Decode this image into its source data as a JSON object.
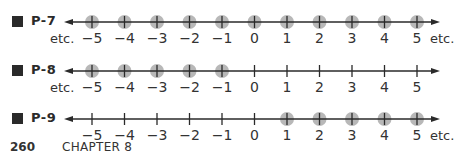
{
  "problems": [
    {
      "label": "P-7",
      "ticks": [
        "−5",
        "−4",
        "−3",
        "−2",
        "−1",
        "0",
        "1",
        "2",
        "3",
        "4",
        "5"
      ],
      "values": [
        -5,
        -4,
        -3,
        -2,
        -1,
        0,
        1,
        2,
        3,
        4,
        5
      ],
      "highlighted": [
        -5,
        -4,
        -3,
        -2,
        -1,
        0,
        1,
        2,
        3,
        4,
        5
      ],
      "left_etc": "etc.",
      "right_etc": "etc."
    },
    {
      "label": "P-8",
      "ticks": [
        "−5",
        "−4",
        "−3",
        "−2",
        "−1",
        "0",
        "1",
        "2",
        "3",
        "4",
        "5"
      ],
      "values": [
        -5,
        -4,
        -3,
        -2,
        -1,
        0,
        1,
        2,
        3,
        4,
        5
      ],
      "highlighted": [
        -5,
        -4,
        -3,
        -2,
        -1
      ],
      "left_etc": "etc.",
      "right_etc": ""
    },
    {
      "label": "P-9",
      "ticks": [
        "−5",
        "−4",
        "−3",
        "−2",
        "−1",
        "0",
        "1",
        "2",
        "3",
        "4",
        "5"
      ],
      "values": [
        -5,
        -4,
        -3,
        -2,
        -1,
        0,
        1,
        2,
        3,
        4,
        5
      ],
      "highlighted": [
        1,
        2,
        3,
        4,
        5
      ],
      "left_etc": "",
      "right_etc": "etc."
    }
  ],
  "footer": {
    "page_number": "260",
    "chapter": "CHAPTER 8"
  },
  "colors": {
    "ink": "#2a2a2a",
    "highlight": "#b8b8b8"
  }
}
